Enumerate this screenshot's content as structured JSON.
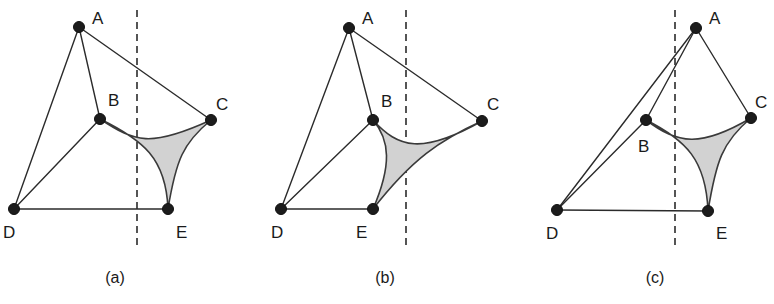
{
  "figure": {
    "title": "",
    "background_color": "#ffffff",
    "width": 774,
    "height": 304,
    "node_color": "#1c1c1c",
    "edge_color": "#2b2b2b",
    "region_fill_color": "#d2d2d2",
    "region_stroke_color": "#3a3a3a",
    "cut_line_color": "#2b2b2b",
    "node_radius": 5.5
  },
  "panels": [
    {
      "id": "panel-a",
      "caption": "(a)",
      "caption_pos": {
        "x": 115,
        "y": 283
      },
      "cut_line": {
        "x": 137,
        "y1": 10,
        "y2": 246
      },
      "nodes": [
        {
          "id": "A",
          "label": "A",
          "x": 79,
          "y": 27,
          "label_x": 92,
          "label_y": 24
        },
        {
          "id": "B",
          "label": "B",
          "x": 100,
          "y": 119,
          "label_x": 108,
          "label_y": 106
        },
        {
          "id": "C",
          "label": "C",
          "x": 211,
          "y": 120,
          "label_x": 216,
          "label_y": 110
        },
        {
          "id": "D",
          "label": "D",
          "x": 14,
          "y": 209,
          "label_x": 3,
          "label_y": 238
        },
        {
          "id": "E",
          "label": "E",
          "x": 168,
          "y": 209,
          "label_x": 176,
          "label_y": 238
        }
      ],
      "edges": [
        {
          "from": "A",
          "to": "B"
        },
        {
          "from": "A",
          "to": "C"
        },
        {
          "from": "A",
          "to": "D"
        },
        {
          "from": "B",
          "to": "D"
        },
        {
          "from": "D",
          "to": "E"
        }
      ],
      "region": {
        "cusps": [
          "B",
          "C",
          "E"
        ],
        "path": "M 100 119 C 135 142 150 148 211 120 C 183 143 176 160 168 209 C 166 158 143 140 100 119 Z"
      }
    },
    {
      "id": "panel-b",
      "caption": "(b)",
      "caption_pos": {
        "x": 385,
        "y": 283
      },
      "cut_line": {
        "x": 406,
        "y1": 10,
        "y2": 246
      },
      "nodes": [
        {
          "id": "A",
          "label": "A",
          "x": 349,
          "y": 28,
          "label_x": 362,
          "label_y": 24
        },
        {
          "id": "B",
          "label": "B",
          "x": 373,
          "y": 120,
          "label_x": 381,
          "label_y": 107
        },
        {
          "id": "C",
          "label": "C",
          "x": 482,
          "y": 121,
          "label_x": 487,
          "label_y": 110
        },
        {
          "id": "D",
          "label": "D",
          "x": 281,
          "y": 209,
          "label_x": 271,
          "label_y": 238
        },
        {
          "id": "E",
          "label": "E",
          "x": 373,
          "y": 209,
          "label_x": 356,
          "label_y": 238
        }
      ],
      "edges": [
        {
          "from": "A",
          "to": "B"
        },
        {
          "from": "A",
          "to": "C"
        },
        {
          "from": "A",
          "to": "D"
        },
        {
          "from": "B",
          "to": "D"
        },
        {
          "from": "D",
          "to": "E"
        }
      ],
      "region": {
        "cusps": [
          "B",
          "C",
          "E"
        ],
        "path": "M 373 120 C 398 148 422 155 482 121 C 440 140 412 159 373 209 C 392 165 390 140 373 120 Z"
      }
    },
    {
      "id": "panel-c",
      "caption": "(c)",
      "caption_pos": {
        "x": 655,
        "y": 283
      },
      "cut_line": {
        "x": 675,
        "y1": 10,
        "y2": 246
      },
      "nodes": [
        {
          "id": "A",
          "label": "A",
          "x": 696,
          "y": 28,
          "label_x": 709,
          "label_y": 24
        },
        {
          "id": "B",
          "label": "B",
          "x": 646,
          "y": 120,
          "label_x": 638,
          "label_y": 152
        },
        {
          "id": "C",
          "label": "C",
          "x": 751,
          "y": 118,
          "label_x": 755,
          "label_y": 108
        },
        {
          "id": "D",
          "label": "D",
          "x": 557,
          "y": 210,
          "label_x": 546,
          "label_y": 239
        },
        {
          "id": "E",
          "label": "E",
          "x": 708,
          "y": 211,
          "label_x": 716,
          "label_y": 239
        }
      ],
      "edges": [
        {
          "from": "A",
          "to": "B"
        },
        {
          "from": "A",
          "to": "C"
        },
        {
          "from": "A",
          "to": "D"
        },
        {
          "from": "B",
          "to": "D"
        },
        {
          "from": "D",
          "to": "E"
        }
      ],
      "region": {
        "cusps": [
          "B",
          "C",
          "E"
        ],
        "path": "M 646 120 C 678 144 700 148 751 118 C 722 142 716 162 708 211 C 706 160 686 140 646 120 Z"
      }
    }
  ]
}
